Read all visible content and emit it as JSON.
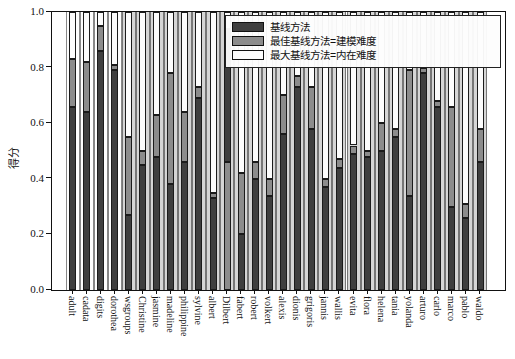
{
  "figure": {
    "background": "#ffffff"
  },
  "axes": {
    "ylabel": "得分",
    "yticks": [
      "0.0",
      "0.2",
      "0.4",
      "0.6",
      "0.8",
      "1.0"
    ],
    "xlabel": ""
  },
  "colors": {
    "dark": "#3f3f3f",
    "gray": "#8c8c8c",
    "white": "#fcfcfc",
    "panel_white": "#fdfdfd",
    "panel_gray": "#d5d5d5",
    "edge": "#1b1b1b"
  },
  "legend": {
    "items": [
      {
        "label": "基线方法",
        "color_key": "dark"
      },
      {
        "label": "最佳基线方法=建模难度",
        "color_key": "gray"
      },
      {
        "label": "最大基线方法=内在难度",
        "color_key": "white"
      }
    ]
  },
  "chart_data": {
    "type": "bar",
    "stacked": true,
    "title": "",
    "ylabel": "得分",
    "ylim": [
      0,
      1
    ],
    "yticks": [
      0.0,
      0.2,
      0.4,
      0.6,
      0.8,
      1.0
    ],
    "grid": false,
    "legend_position": "upper right",
    "series_names": [
      "基线方法",
      "最佳基线方法=建模难度",
      "最大基线方法=内在难度"
    ],
    "panel_note": "wide background columns behind each bar: white for first 4 categories, light gray afterwards; all reach 1.0",
    "panels_white_through_index": 3,
    "categories": [
      "adult",
      "cadata",
      "digits",
      "dorothea",
      "wsgroups",
      "Christine",
      "jasmine",
      "madeline",
      "philippine",
      "sylvine",
      "albert",
      "Dilbert",
      "fabert",
      "robert",
      "volkert",
      "alexis",
      "dionis",
      "grigoris",
      "jannis",
      "wallis",
      "evita",
      "flora",
      "helena",
      "tania",
      "yolanda",
      "arturo",
      "carlo",
      "marco",
      "pablo",
      "waldo"
    ],
    "bars": [
      {
        "label": "adult",
        "segments": [
          {
            "to": 0.66,
            "color": "dark"
          },
          {
            "to": 0.83,
            "color": "gray"
          },
          {
            "to": 1.0,
            "color": "white"
          }
        ]
      },
      {
        "label": "cadata",
        "segments": [
          {
            "to": 0.64,
            "color": "dark"
          },
          {
            "to": 0.82,
            "color": "gray"
          },
          {
            "to": 1.0,
            "color": "white"
          }
        ]
      },
      {
        "label": "digits",
        "segments": [
          {
            "to": 0.86,
            "color": "dark"
          },
          {
            "to": 0.95,
            "color": "gray"
          },
          {
            "to": 1.0,
            "color": "white"
          }
        ]
      },
      {
        "label": "dorothea",
        "segments": [
          {
            "to": 0.79,
            "color": "dark"
          },
          {
            "to": 0.81,
            "color": "gray"
          },
          {
            "to": 1.0,
            "color": "white"
          }
        ]
      },
      {
        "label": "wsgroups",
        "segments": [
          {
            "to": 0.27,
            "color": "dark"
          },
          {
            "to": 0.55,
            "color": "gray"
          },
          {
            "to": 1.0,
            "color": "white"
          }
        ]
      },
      {
        "label": "Christine",
        "segments": [
          {
            "to": 0.45,
            "color": "dark"
          },
          {
            "to": 0.5,
            "color": "gray"
          },
          {
            "to": 1.0,
            "color": "white"
          }
        ]
      },
      {
        "label": "jasmine",
        "segments": [
          {
            "to": 0.48,
            "color": "dark"
          },
          {
            "to": 0.63,
            "color": "gray"
          },
          {
            "to": 1.0,
            "color": "white"
          }
        ]
      },
      {
        "label": "madeline",
        "segments": [
          {
            "to": 0.38,
            "color": "dark"
          },
          {
            "to": 0.78,
            "color": "gray"
          },
          {
            "to": 1.0,
            "color": "white"
          }
        ]
      },
      {
        "label": "philippine",
        "segments": [
          {
            "to": 0.46,
            "color": "dark"
          },
          {
            "to": 0.64,
            "color": "gray"
          },
          {
            "to": 1.0,
            "color": "white"
          }
        ]
      },
      {
        "label": "sylvine",
        "segments": [
          {
            "to": 0.69,
            "color": "dark"
          },
          {
            "to": 0.73,
            "color": "gray"
          },
          {
            "to": 1.0,
            "color": "white"
          }
        ]
      },
      {
        "label": "albert",
        "segments": [
          {
            "to": 0.33,
            "color": "dark"
          },
          {
            "to": 0.35,
            "color": "gray"
          },
          {
            "to": 1.0,
            "color": "white"
          }
        ]
      },
      {
        "label": "Dilbert",
        "segments": [
          {
            "to": 0.46,
            "color": "gray"
          },
          {
            "to": 0.94,
            "color": "dark"
          },
          {
            "to": 1.0,
            "color": "white"
          }
        ]
      },
      {
        "label": "fabert",
        "segments": [
          {
            "to": 0.2,
            "color": "dark"
          },
          {
            "to": 0.42,
            "color": "gray"
          },
          {
            "to": 1.0,
            "color": "white"
          }
        ]
      },
      {
        "label": "robert",
        "segments": [
          {
            "to": 0.4,
            "color": "dark"
          },
          {
            "to": 0.46,
            "color": "gray"
          },
          {
            "to": 1.0,
            "color": "white"
          }
        ]
      },
      {
        "label": "volkert",
        "segments": [
          {
            "to": 0.34,
            "color": "dark"
          },
          {
            "to": 0.4,
            "color": "gray"
          },
          {
            "to": 1.0,
            "color": "white"
          }
        ]
      },
      {
        "label": "alexis",
        "segments": [
          {
            "to": 0.56,
            "color": "dark"
          },
          {
            "to": 0.7,
            "color": "gray"
          },
          {
            "to": 1.0,
            "color": "white"
          }
        ]
      },
      {
        "label": "dionis",
        "segments": [
          {
            "to": 0.73,
            "color": "dark"
          },
          {
            "to": 0.77,
            "color": "gray"
          },
          {
            "to": 1.0,
            "color": "white"
          }
        ]
      },
      {
        "label": "grigoris",
        "segments": [
          {
            "to": 0.58,
            "color": "dark"
          },
          {
            "to": 0.73,
            "color": "gray"
          },
          {
            "to": 1.0,
            "color": "white"
          }
        ]
      },
      {
        "label": "jannis",
        "segments": [
          {
            "to": 0.37,
            "color": "dark"
          },
          {
            "to": 0.4,
            "color": "gray"
          },
          {
            "to": 1.0,
            "color": "white"
          }
        ]
      },
      {
        "label": "wallis",
        "segments": [
          {
            "to": 0.44,
            "color": "dark"
          },
          {
            "to": 0.47,
            "color": "gray"
          },
          {
            "to": 1.0,
            "color": "white"
          }
        ]
      },
      {
        "label": "evita",
        "segments": [
          {
            "to": 0.49,
            "color": "dark"
          },
          {
            "to": 0.52,
            "color": "gray"
          },
          {
            "to": 1.0,
            "color": "white"
          }
        ]
      },
      {
        "label": "flora",
        "segments": [
          {
            "to": 0.48,
            "color": "dark"
          },
          {
            "to": 0.5,
            "color": "gray"
          },
          {
            "to": 1.0,
            "color": "white"
          }
        ]
      },
      {
        "label": "helena",
        "segments": [
          {
            "to": 0.5,
            "color": "dark"
          },
          {
            "to": 0.6,
            "color": "gray"
          },
          {
            "to": 1.0,
            "color": "white"
          }
        ]
      },
      {
        "label": "tania",
        "segments": [
          {
            "to": 0.55,
            "color": "dark"
          },
          {
            "to": 0.58,
            "color": "gray"
          },
          {
            "to": 1.0,
            "color": "white"
          }
        ]
      },
      {
        "label": "yolanda",
        "segments": [
          {
            "to": 0.34,
            "color": "dark"
          },
          {
            "to": 0.79,
            "color": "gray"
          },
          {
            "to": 1.0,
            "color": "white"
          }
        ]
      },
      {
        "label": "arturo",
        "segments": [
          {
            "to": 0.78,
            "color": "dark"
          },
          {
            "to": 0.8,
            "color": "gray"
          },
          {
            "to": 1.0,
            "color": "white"
          }
        ]
      },
      {
        "label": "carlo",
        "segments": [
          {
            "to": 0.66,
            "color": "dark"
          },
          {
            "to": 0.68,
            "color": "gray"
          },
          {
            "to": 1.0,
            "color": "white"
          }
        ]
      },
      {
        "label": "marco",
        "segments": [
          {
            "to": 0.3,
            "color": "dark"
          },
          {
            "to": 0.66,
            "color": "gray"
          },
          {
            "to": 1.0,
            "color": "white"
          }
        ]
      },
      {
        "label": "pablo",
        "segments": [
          {
            "to": 0.26,
            "color": "dark"
          },
          {
            "to": 0.31,
            "color": "gray"
          },
          {
            "to": 1.0,
            "color": "white"
          }
        ]
      },
      {
        "label": "waldo",
        "segments": [
          {
            "to": 0.46,
            "color": "dark"
          },
          {
            "to": 0.58,
            "color": "gray"
          },
          {
            "to": 1.0,
            "color": "white"
          }
        ]
      }
    ]
  }
}
